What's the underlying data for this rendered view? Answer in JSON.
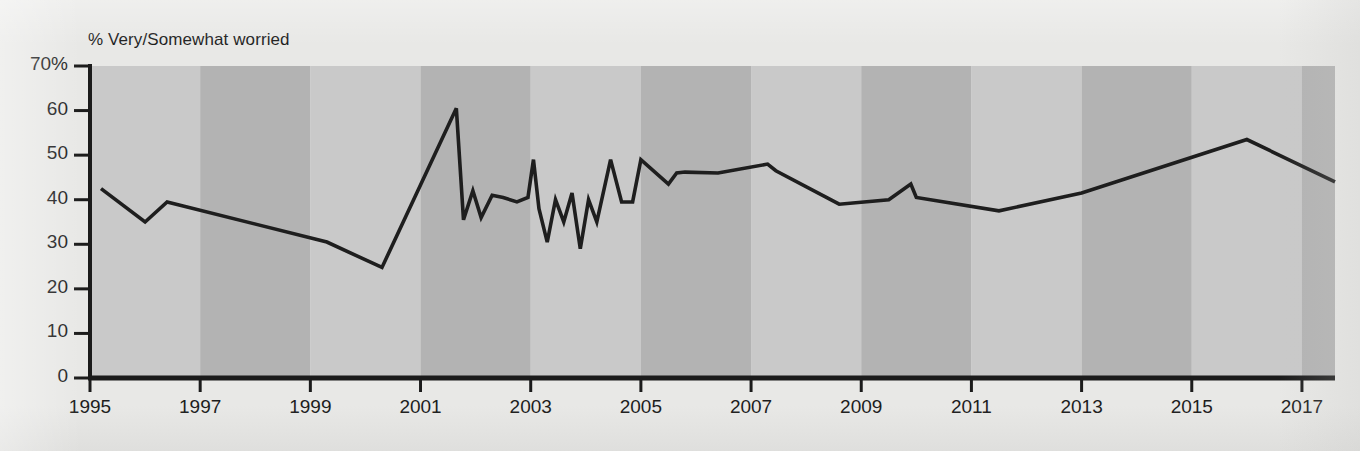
{
  "chart_data": {
    "type": "line",
    "title": "% Very/Somewhat worried",
    "xlabel": "",
    "ylabel": "% Very/Somewhat worried",
    "xlim": [
      1995.0,
      2017.6
    ],
    "ylim": [
      0,
      70
    ],
    "grid": false,
    "legend": "none",
    "y_ticks": [
      "70%",
      "60",
      "50",
      "40",
      "30",
      "20",
      "10",
      "0"
    ],
    "y_tick_values": [
      70,
      60,
      50,
      40,
      30,
      20,
      10,
      0
    ],
    "x_ticks": [
      "1995",
      "1997",
      "1999",
      "2001",
      "2003",
      "2005",
      "2007",
      "2009",
      "2011",
      "2013",
      "2015",
      "2017"
    ],
    "x_tick_values": [
      1995,
      1997,
      1999,
      2001,
      2003,
      2005,
      2007,
      2009,
      2011,
      2013,
      2015,
      2017
    ],
    "background_bands": {
      "note": "alternating vertical bands, 2-year wide, starting at 1995",
      "light_color": "#c9c9c9",
      "dark_color": "#b3b3b3"
    },
    "line_color": "#1e1e1e",
    "line_width": 3.6,
    "series": [
      {
        "name": "% Very/Somewhat worried",
        "x": [
          1995.2,
          1996.0,
          1996.4,
          1999.3,
          2000.3,
          2001.65,
          2001.78,
          2001.95,
          2002.1,
          2002.3,
          2002.5,
          2002.75,
          2002.95,
          2003.05,
          2003.15,
          2003.3,
          2003.45,
          2003.6,
          2003.75,
          2003.9,
          2004.05,
          2004.2,
          2004.45,
          2004.65,
          2004.85,
          2005.0,
          2005.5,
          2005.65,
          2005.8,
          2006.4,
          2007.3,
          2007.45,
          2008.6,
          2009.5,
          2009.9,
          2010.0,
          2011.5,
          2013.0,
          2016.0,
          2017.6
        ],
        "y": [
          42.5,
          35.0,
          39.5,
          30.5,
          24.8,
          60.5,
          35.5,
          42.0,
          36.0,
          41.0,
          40.5,
          39.5,
          40.5,
          49.0,
          38.0,
          30.5,
          40.0,
          35.0,
          41.5,
          29.0,
          40.0,
          35.0,
          49.0,
          39.5,
          39.5,
          49.0,
          43.5,
          46.0,
          46.2,
          46.0,
          48.0,
          46.5,
          39.0,
          40.0,
          43.5,
          40.5,
          37.5,
          41.5,
          53.5,
          44.0
        ]
      }
    ]
  },
  "axes": {
    "y_axis_name": "y-axis",
    "x_axis_name": "x-axis"
  }
}
